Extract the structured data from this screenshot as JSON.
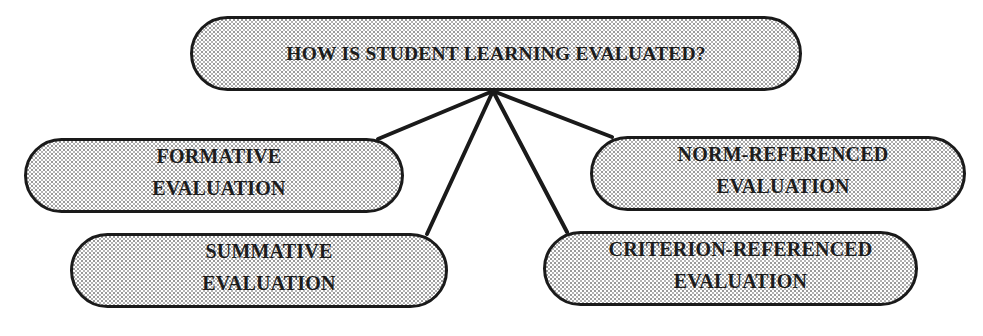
{
  "diagram": {
    "type": "hierarchy",
    "root": {
      "label": "HOW IS STUDENT LEARNING EVALUATED?",
      "box": {
        "x": 190,
        "y": 16,
        "w": 612,
        "h": 75
      }
    },
    "junction": {
      "x": 493,
      "y": 91
    },
    "children": [
      {
        "id": "formative",
        "lines": [
          "FORMATIVE",
          "EVALUATION"
        ],
        "box": {
          "x": 24,
          "y": 138,
          "w": 380,
          "h": 75
        },
        "text_offset_x": 5,
        "text_top": 5,
        "anchor": {
          "x": 378,
          "y": 139
        }
      },
      {
        "id": "summative",
        "lines": [
          "SUMMATIVE",
          "EVALUATION"
        ],
        "box": {
          "x": 70,
          "y": 233,
          "w": 378,
          "h": 75
        },
        "text_offset_x": 10,
        "text_top": 5,
        "anchor": {
          "x": 427,
          "y": 234
        }
      },
      {
        "id": "norm-referenced",
        "lines": [
          "NORM-REFERENCED",
          "EVALUATION"
        ],
        "box": {
          "x": 590,
          "y": 136,
          "w": 376,
          "h": 75
        },
        "text_offset_x": 5,
        "text_top": 5,
        "anchor": {
          "x": 612,
          "y": 137
        }
      },
      {
        "id": "criterion-referenced",
        "lines": [
          "CRITERION-REFERENCED",
          "EVALUATION"
        ],
        "box": {
          "x": 543,
          "y": 231,
          "w": 375,
          "h": 75
        },
        "text_offset_x": 10,
        "text_top": 5,
        "anchor": {
          "x": 567,
          "y": 232
        }
      }
    ],
    "colors": {
      "stroke": "#1a1a1a",
      "text": "#1c1c1c",
      "fill_dot": "#9a9a9a",
      "background": "#ffffff"
    }
  }
}
